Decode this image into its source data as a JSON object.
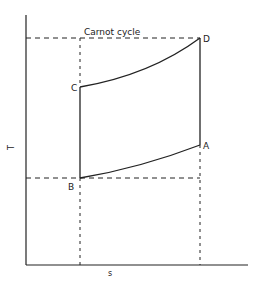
{
  "diagram": {
    "title": "Carnot cycle",
    "axes": {
      "x_label": "s",
      "y_label": "T"
    },
    "points": {
      "A": {
        "label": "A"
      },
      "B": {
        "label": "B"
      },
      "C": {
        "label": "C"
      },
      "D": {
        "label": "D"
      }
    },
    "colors": {
      "line": "#222222",
      "background": "#ffffff"
    }
  }
}
